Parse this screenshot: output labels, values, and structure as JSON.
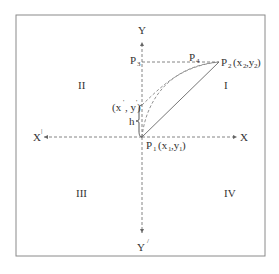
{
  "diagram": {
    "colors": {
      "stroke": "#666666",
      "text": "#333333",
      "frame": "#8a8a8a",
      "background": "#ffffff"
    },
    "axes": {
      "y_positive_label": "Y",
      "y_negative_label": "Y",
      "y_negative_prime": "/",
      "x_positive_label": "X",
      "x_negative_label": "X",
      "x_negative_prime": "|"
    },
    "quadrants": {
      "q1": "I",
      "q2": "II",
      "q3": "III",
      "q4": "IV"
    },
    "points": {
      "p1": {
        "name": "P",
        "index": "1",
        "coords_open": "(x",
        "coords_sub1": "1",
        "coords_mid": ",y",
        "coords_sub2": "1",
        "coords_close": ")"
      },
      "p2": {
        "name": "P",
        "index": "2",
        "coords_open": "(x",
        "coords_sub1": "2",
        "coords_mid": ",y",
        "coords_sub2": "2",
        "coords_close": ")"
      },
      "p3": {
        "name": "P",
        "index": "3"
      },
      "p4": {
        "name": "P",
        "index": "4"
      },
      "intermediate": {
        "label_open": "(x",
        "label_prime1": "'",
        "label_mid": ", y",
        "label_prime2": "'",
        "label_close": ")"
      }
    },
    "height_label": "h"
  }
}
